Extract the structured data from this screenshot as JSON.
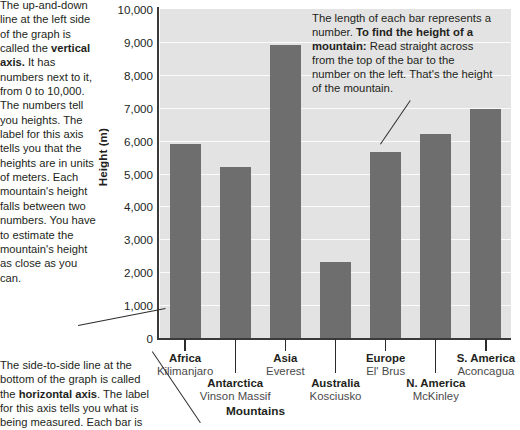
{
  "chart_data": {
    "type": "bar",
    "title": "",
    "xlabel": "Mountains",
    "ylabel": "Height (m)",
    "ylim": [
      0,
      10000
    ],
    "ytick_labels": [
      "10,000",
      "9,000",
      "8,000",
      "7,000",
      "6,000",
      "5,000",
      "4,000",
      "3,000",
      "2,000",
      "1,000",
      "0"
    ],
    "ytick_values": [
      10000,
      9000,
      8000,
      7000,
      6000,
      5000,
      4000,
      3000,
      2000,
      1000,
      0
    ],
    "grid": true,
    "legend": "none",
    "categories": [
      "Africa Kilimanjaro",
      "Antarctica Vinson Massif",
      "Asia Everest",
      "Australia Kosciusko",
      "Europe El' Brus",
      "N. America McKinley",
      "S. America Aconcagua"
    ],
    "values": [
      5900,
      5200,
      8900,
      2300,
      5650,
      6200,
      6950
    ],
    "bar_color": "#6e6e6e",
    "plot_background": "#e3e3e3",
    "bars": [
      {
        "continent": "Africa",
        "mountain": "Kilimanjaro",
        "value": 5900,
        "row": 1
      },
      {
        "continent": "Antarctica",
        "mountain": "Vinson Massif",
        "value": 5200,
        "row": 2
      },
      {
        "continent": "Asia",
        "mountain": "Everest",
        "value": 8900,
        "row": 1
      },
      {
        "continent": "Australia",
        "mountain": "Kosciusko",
        "value": 2300,
        "row": 2
      },
      {
        "continent": "Europe",
        "mountain": "El' Brus",
        "value": 5650,
        "row": 1
      },
      {
        "continent": "N. America",
        "mountain": "McKinley",
        "value": 6200,
        "row": 2
      },
      {
        "continent": "S. America",
        "mountain": "Aconcagua",
        "value": 6950,
        "row": 1
      }
    ]
  },
  "annotations": {
    "vertical_axis_note_part1": "The up-and-down line at the left side of the graph is called the ",
    "vertical_axis_note_bold": "vertical axis.",
    "vertical_axis_note_part2": " It has numbers next to it, from 0 to 10,000. The numbers tell you heights. The label for this axis tells you that the heights are in units of meters. Each mountain's height falls between two numbers. You have to estimate the mountain's height as close as you can.",
    "horizontal_axis_note_part1": "The side-to-side line at the bottom of the graph is called the ",
    "horizontal_axis_note_bold": "horizontal axis",
    "horizontal_axis_note_part2": ". The label for this axis tells you what is being measured. Each bar is",
    "callout_part1": "The length of each bar represents a number. ",
    "callout_bold": "To find the height of a mountain:",
    "callout_part2": " Read straight across from the top of the bar to the number on the left. That's the height of the mountain."
  },
  "colors": {
    "bar": "#6e6e6e",
    "plot_bg": "#e3e3e3",
    "gridline": "#fbfbfb",
    "axis": "#3a3a3a",
    "text": "#231f20"
  }
}
